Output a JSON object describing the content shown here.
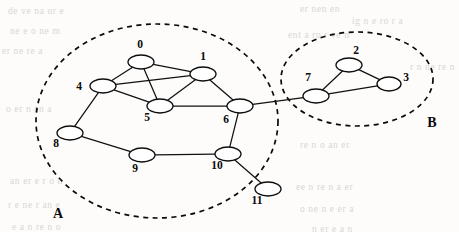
{
  "figure": {
    "background_color": "#fdfcfa",
    "stroke_color": "#111111",
    "node_fill_color": "#ffffff",
    "width": 459,
    "height": 232
  },
  "graph_data": {
    "type": "node-link-diagram",
    "directed": false,
    "node_count": 12,
    "edge_count": 14,
    "node_ids": [
      "0",
      "1",
      "2",
      "3",
      "4",
      "5",
      "6",
      "7",
      "8",
      "9",
      "10",
      "11"
    ],
    "nodes": [
      {
        "id": "0",
        "label": "0",
        "cx": 141,
        "cy": 62,
        "rx": 13,
        "ry": 7,
        "label_x": 140,
        "label_y": 48,
        "label_anchor": "middle",
        "cluster": "A"
      },
      {
        "id": "1",
        "label": "1",
        "cx": 203,
        "cy": 74,
        "rx": 13,
        "ry": 7,
        "label_x": 203,
        "label_y": 60,
        "label_anchor": "middle",
        "cluster": "A"
      },
      {
        "id": "2",
        "label": "2",
        "cx": 349,
        "cy": 65,
        "rx": 13,
        "ry": 7,
        "label_x": 356,
        "label_y": 54,
        "label_anchor": "middle",
        "cluster": "B"
      },
      {
        "id": "3",
        "label": "3",
        "cx": 389,
        "cy": 84,
        "rx": 12,
        "ry": 7,
        "label_x": 406,
        "label_y": 81,
        "label_anchor": "middle",
        "cluster": "B"
      },
      {
        "id": "4",
        "label": "4",
        "cx": 103,
        "cy": 86,
        "rx": 13,
        "ry": 7,
        "label_x": 79,
        "label_y": 90,
        "label_anchor": "middle",
        "cluster": "A"
      },
      {
        "id": "5",
        "label": "5",
        "cx": 160,
        "cy": 106,
        "rx": 13,
        "ry": 7,
        "label_x": 147,
        "label_y": 121,
        "label_anchor": "middle",
        "cluster": "A"
      },
      {
        "id": "6",
        "label": "6",
        "cx": 240,
        "cy": 106,
        "rx": 13,
        "ry": 7,
        "label_x": 226,
        "label_y": 123,
        "label_anchor": "middle",
        "cluster": "A"
      },
      {
        "id": "7",
        "label": "7",
        "cx": 316,
        "cy": 96,
        "rx": 13,
        "ry": 7,
        "label_x": 308,
        "label_y": 81,
        "label_anchor": "middle",
        "cluster": "B"
      },
      {
        "id": "8",
        "label": "8",
        "cx": 70,
        "cy": 133,
        "rx": 13,
        "ry": 7,
        "label_x": 56,
        "label_y": 147,
        "label_anchor": "middle",
        "cluster": "A"
      },
      {
        "id": "9",
        "label": "9",
        "cx": 142,
        "cy": 155,
        "rx": 13,
        "ry": 7,
        "label_x": 135,
        "label_y": 172,
        "label_anchor": "middle",
        "cluster": "A"
      },
      {
        "id": "10",
        "label": "10",
        "cx": 228,
        "cy": 154,
        "rx": 13,
        "ry": 7,
        "label_x": 217,
        "label_y": 169,
        "label_anchor": "middle",
        "cluster": "A"
      },
      {
        "id": "11",
        "label": "11",
        "cx": 268,
        "cy": 189,
        "rx": 13,
        "ry": 7,
        "label_x": 257,
        "label_y": 204,
        "label_anchor": "middle",
        "cluster": "A"
      }
    ],
    "edges": [
      {
        "source": "0",
        "target": "4"
      },
      {
        "source": "0",
        "target": "1"
      },
      {
        "source": "0",
        "target": "5"
      },
      {
        "source": "4",
        "target": "1"
      },
      {
        "source": "4",
        "target": "5"
      },
      {
        "source": "1",
        "target": "5"
      },
      {
        "source": "1",
        "target": "6"
      },
      {
        "source": "5",
        "target": "6"
      },
      {
        "source": "4",
        "target": "8"
      },
      {
        "source": "8",
        "target": "9"
      },
      {
        "source": "9",
        "target": "10"
      },
      {
        "source": "6",
        "target": "10"
      },
      {
        "source": "10",
        "target": "11"
      },
      {
        "source": "6",
        "target": "7"
      },
      {
        "source": "7",
        "target": "2"
      },
      {
        "source": "7",
        "target": "3"
      },
      {
        "source": "2",
        "target": "3"
      }
    ],
    "clusters": [
      {
        "id": "A",
        "label": "A",
        "cx": 157,
        "cy": 121,
        "rx": 121,
        "ry": 97,
        "rotation": 0,
        "label_x": 58,
        "label_y": 218,
        "members": [
          "0",
          "1",
          "4",
          "5",
          "6",
          "8",
          "9",
          "10",
          "11"
        ]
      },
      {
        "id": "B",
        "label": "B",
        "cx": 357,
        "cy": 79,
        "rx": 76,
        "ry": 47,
        "rotation": 0,
        "label_x": 432,
        "label_y": 127,
        "members": [
          "2",
          "3",
          "7"
        ]
      }
    ],
    "bridge_edges": [
      {
        "source": "6",
        "target": "7",
        "note": "inter-cluster link between A and B"
      }
    ]
  },
  "bleed_through": {
    "note": "faint reverse-side print visible in scan",
    "lines": [
      {
        "text": "de ve na  ur  e",
        "x": 8,
        "y": 6
      },
      {
        "text": "er  nen  en",
        "x": 300,
        "y": 4
      },
      {
        "text": "ig   n  e ro  r  a",
        "x": 352,
        "y": 16
      },
      {
        "text": "ne   e  o  ne  m",
        "x": 10,
        "y": 26
      },
      {
        "text": "ent  a  ro  r  ve  n",
        "x": 288,
        "y": 30
      },
      {
        "text": "er  ne  re  a",
        "x": 2,
        "y": 46
      },
      {
        "text": "r  n  ue   re  n",
        "x": 410,
        "y": 62
      },
      {
        "text": "o  er  n  en  a",
        "x": 6,
        "y": 104
      },
      {
        "text": "re  n  o  an  er",
        "x": 300,
        "y": 140
      },
      {
        "text": "an  er  e  r  o  n",
        "x": 10,
        "y": 176
      },
      {
        "text": "ee   n  re  n  a  er",
        "x": 296,
        "y": 182
      },
      {
        "text": "r  e  ne  r  an  e",
        "x": 8,
        "y": 200
      },
      {
        "text": "o  ne  n  e  er  a",
        "x": 300,
        "y": 204
      },
      {
        "text": "e  a  n  re  n  o",
        "x": 12,
        "y": 222
      },
      {
        "text": "n  er  e  a  n",
        "x": 312,
        "y": 224
      }
    ]
  }
}
